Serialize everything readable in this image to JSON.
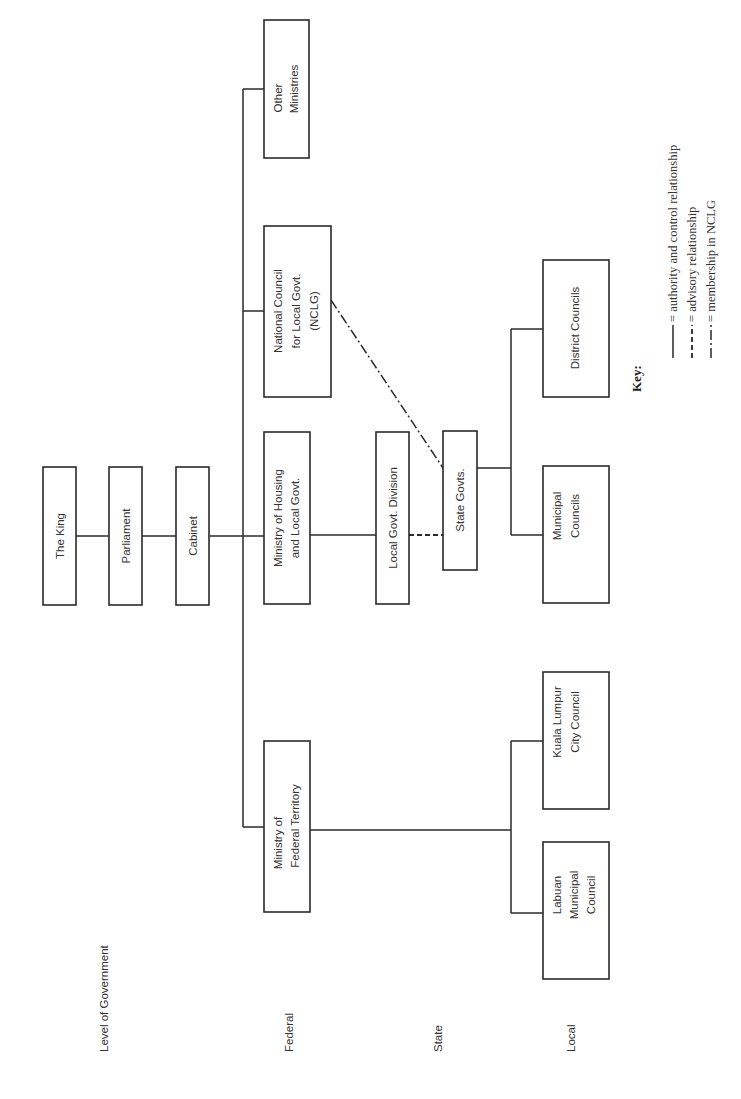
{
  "diagram": {
    "orientation": "rotated 90° counter-clockwise",
    "level_heading": "Level of Government",
    "levels": [
      {
        "label": "Federal"
      },
      {
        "label": "State"
      },
      {
        "label": "Local"
      }
    ],
    "nodes": {
      "king": {
        "lines": [
          "The King"
        ]
      },
      "parliament": {
        "lines": [
          "Parliament"
        ]
      },
      "cabinet": {
        "lines": [
          "Cabinet"
        ]
      },
      "other_ministries": {
        "lines": [
          "Other",
          "Ministries"
        ]
      },
      "nclg": {
        "lines": [
          "National Council",
          "for Local Govt.",
          "(NCLG)"
        ]
      },
      "housing": {
        "lines": [
          "Ministry of Housing",
          "and Local Govt."
        ]
      },
      "federal_territory": {
        "lines": [
          "Ministry of",
          "Federal Territory"
        ]
      },
      "local_govt_division": {
        "lines": [
          "Local Govt. Division"
        ]
      },
      "state_govts": {
        "lines": [
          "State Govts."
        ]
      },
      "district_councils": {
        "lines": [
          "District Councils"
        ]
      },
      "municipal_councils": {
        "lines": [
          "Municipal",
          "Councils"
        ]
      },
      "kl_city_council": {
        "lines": [
          "Kuala Lumpur",
          "City Council"
        ]
      },
      "labuan": {
        "lines": [
          "Labuan",
          "Municipal",
          "Council"
        ]
      }
    },
    "edges": [
      {
        "from": "king",
        "to": "parliament",
        "type": "authority"
      },
      {
        "from": "parliament",
        "to": "cabinet",
        "type": "authority"
      },
      {
        "from": "cabinet",
        "to": "other_ministries",
        "type": "authority"
      },
      {
        "from": "cabinet",
        "to": "nclg",
        "type": "authority"
      },
      {
        "from": "cabinet",
        "to": "housing",
        "type": "authority"
      },
      {
        "from": "cabinet",
        "to": "federal_territory",
        "type": "authority"
      },
      {
        "from": "housing",
        "to": "local_govt_division",
        "type": "authority"
      },
      {
        "from": "local_govt_division",
        "to": "state_govts",
        "type": "advisory"
      },
      {
        "from": "state_govts",
        "to": "nclg",
        "type": "membership"
      },
      {
        "from": "state_govts",
        "to": "district_councils",
        "type": "authority"
      },
      {
        "from": "state_govts",
        "to": "municipal_councils",
        "type": "authority"
      },
      {
        "from": "federal_territory",
        "to": "kl_city_council",
        "type": "authority"
      },
      {
        "from": "federal_territory",
        "to": "labuan",
        "type": "authority"
      }
    ],
    "key": {
      "title": "Key:",
      "items": [
        {
          "line": "solid",
          "label": "= authority and control relationship"
        },
        {
          "line": "dashed",
          "label": "= advisory relationship"
        },
        {
          "line": "dash-dot",
          "label": "= membership in NCLG"
        }
      ]
    }
  }
}
